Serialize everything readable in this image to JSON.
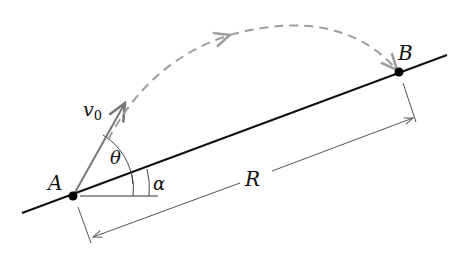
{
  "diagram": {
    "type": "projectile-on-incline",
    "labels": {
      "point_a": "A",
      "point_b": "B",
      "velocity": "v",
      "velocity_subscript": "0",
      "launch_angle": "θ",
      "incline_angle": "α",
      "range": "R"
    },
    "colors": {
      "ground_line": "#111111",
      "ground_shade": "#9a9a9a",
      "trajectory": "#9e9e9e",
      "velocity_vector": "#777777",
      "dimension_line": "#555555",
      "points": "#000000"
    }
  }
}
